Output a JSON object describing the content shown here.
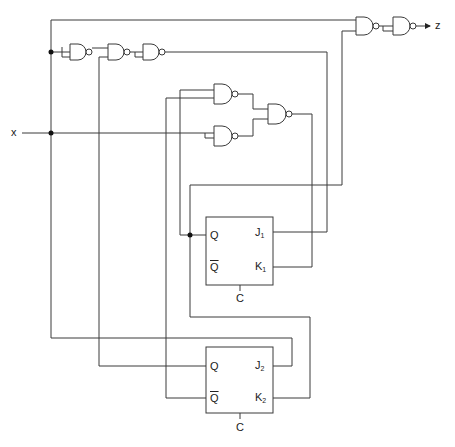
{
  "diagram": {
    "type": "sequential logic circuit",
    "input_label": "x",
    "output_label": "z",
    "gates": [
      {
        "id": "G1",
        "type": "NAND",
        "inputs": "node-top (tied)"
      },
      {
        "id": "G2",
        "type": "NAND",
        "inputs": [
          "G1",
          "Q2"
        ]
      },
      {
        "id": "G3",
        "type": "NAND",
        "inputs": "G2 (tied)",
        "output_to": "J1"
      },
      {
        "id": "GA",
        "type": "NAND",
        "inputs": [
          "Q1",
          "Q2_bar"
        ]
      },
      {
        "id": "GB",
        "type": "NAND",
        "inputs": "x (tied)"
      },
      {
        "id": "GD",
        "type": "NAND",
        "inputs": [
          "GA",
          "GB"
        ],
        "output_to": "K1"
      },
      {
        "id": "GE",
        "type": "NAND",
        "inputs": [
          "x-loop",
          "Q1"
        ]
      },
      {
        "id": "GF",
        "type": "NAND",
        "inputs": "GE (tied)",
        "output_to": "z"
      }
    ],
    "flipflops": [
      {
        "id": "FF1",
        "q": "Q",
        "qbar": "Q",
        "j": "J",
        "j_sub": "1",
        "k": "K",
        "k_sub": "1",
        "clock": "C"
      },
      {
        "id": "FF2",
        "q": "Q",
        "qbar": "Q",
        "j": "J",
        "j_sub": "2",
        "k": "K",
        "k_sub": "2",
        "clock": "C"
      }
    ]
  },
  "colors": {
    "line": "#3a3a3a",
    "background": "#ffffff"
  }
}
